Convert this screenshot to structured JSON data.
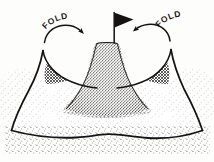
{
  "figure": {
    "type": "hand-drawn line diagram",
    "background_color": "#fdfdfc",
    "ink_color": "#15120f"
  },
  "labels": {
    "fold_left": "FOLD",
    "fold_right": "FOLD"
  },
  "annotations": {
    "left_arrow": "curved-arrow-pointing-right-inward",
    "right_arrow": "curved-arrow-pointing-left-inward"
  },
  "objects": {
    "flag": "black-triangular-pennant-flag",
    "pole": "thin-vertical-flagpole",
    "hill": "stippled-conical-hill",
    "sheet": "draped-cloth-sheet",
    "shadow_left": "cross-hatched-shadow-patch-left",
    "shadow_right": "cross-hatched-shadow-patch-right",
    "ground_shadow": "stippled-ground-shadow"
  }
}
